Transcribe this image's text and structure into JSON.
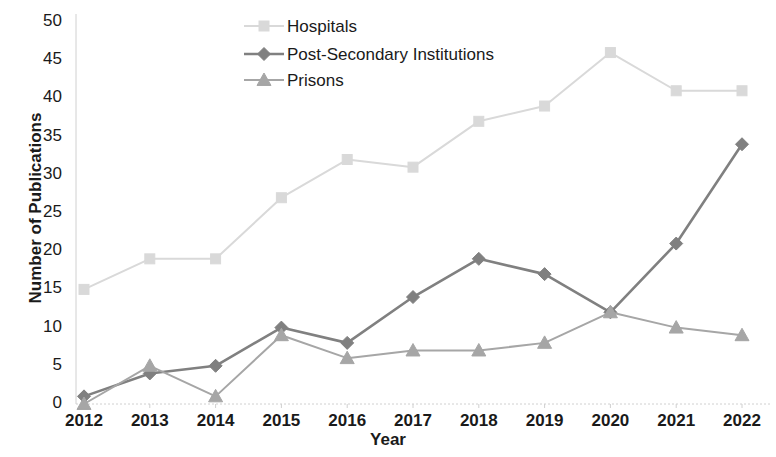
{
  "chart_data": {
    "type": "line",
    "title": "",
    "subtitle": "",
    "xlabel": "Year",
    "ylabel": "Number of Publications",
    "categories": [
      "2012",
      "2013",
      "2014",
      "2015",
      "2016",
      "2017",
      "2018",
      "2019",
      "2020",
      "2021",
      "2022"
    ],
    "x": [
      2012,
      2013,
      2014,
      2015,
      2016,
      2017,
      2018,
      2019,
      2020,
      2021,
      2022
    ],
    "xlim": [
      2012,
      2022
    ],
    "ylim": [
      0,
      50
    ],
    "y_ticks": [
      0,
      5,
      10,
      15,
      20,
      25,
      30,
      35,
      40,
      45,
      50
    ],
    "y_tick_labels": [
      "0",
      "5",
      "10",
      "15",
      "20",
      "25",
      "30",
      "35",
      "40",
      "45",
      "50"
    ],
    "grid": false,
    "legend_position": "top-center",
    "series": [
      {
        "name": "Hospitals",
        "marker": "square",
        "color": "#d9d9d9",
        "values": [
          15,
          19,
          19,
          27,
          32,
          31,
          37,
          39,
          46,
          41,
          41
        ]
      },
      {
        "name": "Post-Secondary Institutions",
        "marker": "diamond",
        "color": "#808080",
        "values": [
          1,
          4,
          5,
          10,
          8,
          14,
          19,
          17,
          12,
          21,
          34
        ]
      },
      {
        "name": "Prisons",
        "marker": "triangle",
        "color": "#a6a6a6",
        "values": [
          0,
          5,
          1,
          9,
          6,
          7,
          7,
          8,
          12,
          10,
          9
        ]
      }
    ]
  },
  "axes": {
    "y_title": "Number of Publications",
    "x_title": "Year"
  },
  "legend": {
    "items": [
      {
        "label": "Hospitals"
      },
      {
        "label": "Post-Secondary Institutions"
      },
      {
        "label": "Prisons"
      }
    ]
  },
  "colors": {
    "hospitals": "#d9d9d9",
    "post_secondary": "#808080",
    "prisons": "#a6a6a6",
    "axis": "#d0d0d0",
    "text": "#1a1a1a"
  }
}
